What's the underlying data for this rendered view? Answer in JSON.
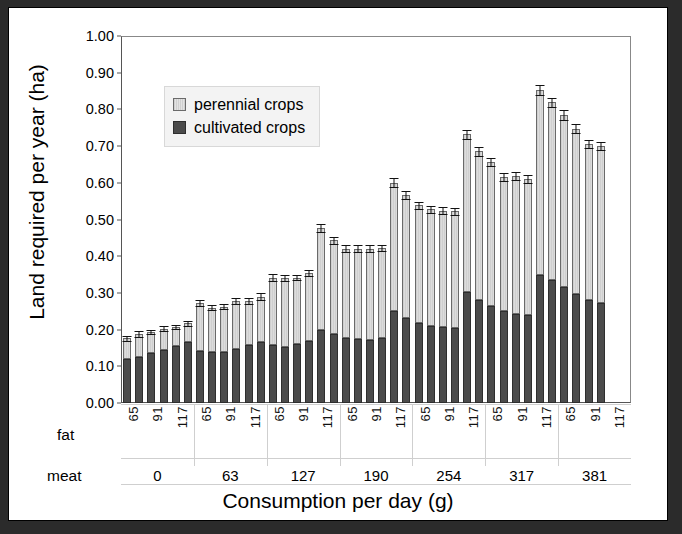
{
  "chart_data": {
    "type": "bar",
    "subtype": "stacked-grouped-column-with-error-bars",
    "title": "",
    "xlabel": "Consumption per day (g)",
    "ylabel": "Land required per year (ha)",
    "ylim": [
      0.0,
      1.0
    ],
    "ytick_labels": [
      "1.00",
      "0.90",
      "0.80",
      "0.70",
      "0.60",
      "0.50",
      "0.40",
      "0.30",
      "0.20",
      "0.10",
      "0.00"
    ],
    "ytick_values": [
      1.0,
      0.9,
      0.8,
      0.7,
      0.6,
      0.5,
      0.4,
      0.3,
      0.2,
      0.1,
      0.0
    ],
    "grid": false,
    "legend_position": "upper-left-inside",
    "axis_row_labels": {
      "fat": "fat",
      "meat": "meat"
    },
    "meat_groups": [
      "0",
      "63",
      "127",
      "190",
      "254",
      "317",
      "381"
    ],
    "fat_levels": [
      "65",
      "91",
      "117"
    ],
    "bars_per_group": 6,
    "series": [
      {
        "name": "cultivated crops",
        "color": "#4b4b4b",
        "values": [
          0.12,
          0.125,
          0.135,
          0.145,
          0.155,
          0.165,
          0.142,
          0.138,
          0.139,
          0.148,
          0.158,
          0.167,
          0.157,
          0.153,
          0.162,
          0.17,
          0.2,
          0.187,
          0.178,
          0.174,
          0.172,
          0.177,
          0.25,
          0.232,
          0.219,
          0.211,
          0.206,
          0.205,
          0.302,
          0.281,
          0.264,
          0.251,
          0.243,
          0.24,
          0.35,
          0.334,
          0.315,
          0.297,
          0.281,
          0.273,
          0.0,
          0.0
        ]
      },
      {
        "name": "perennial crops",
        "color": "#d0d0d0",
        "values": [
          0.056,
          0.063,
          0.058,
          0.058,
          0.052,
          0.052,
          0.13,
          0.122,
          0.123,
          0.129,
          0.121,
          0.123,
          0.185,
          0.188,
          0.18,
          0.184,
          0.278,
          0.256,
          0.243,
          0.247,
          0.249,
          0.245,
          0.35,
          0.335,
          0.32,
          0.317,
          0.318,
          0.317,
          0.43,
          0.405,
          0.392,
          0.364,
          0.376,
          0.37,
          0.503,
          0.485,
          0.47,
          0.45,
          0.425,
          0.427,
          0.0,
          0.0
        ]
      }
    ],
    "totals": [
      0.176,
      0.188,
      0.193,
      0.203,
      0.207,
      0.217,
      0.272,
      0.26,
      0.262,
      0.277,
      0.279,
      0.29,
      0.342,
      0.341,
      0.342,
      0.354,
      0.478,
      0.443,
      0.421,
      0.421,
      0.421,
      0.422,
      0.6,
      0.567,
      0.539,
      0.528,
      0.524,
      0.522,
      0.732,
      0.686,
      0.656,
      0.615,
      0.619,
      0.61,
      0.853,
      0.819,
      0.785,
      0.747,
      0.706,
      0.7,
      0.0,
      0.0
    ],
    "error_bars": [
      0.006,
      0.007,
      0.006,
      0.006,
      0.006,
      0.007,
      0.008,
      0.007,
      0.007,
      0.008,
      0.008,
      0.009,
      0.009,
      0.008,
      0.008,
      0.009,
      0.011,
      0.01,
      0.009,
      0.009,
      0.009,
      0.009,
      0.012,
      0.011,
      0.01,
      0.01,
      0.01,
      0.01,
      0.013,
      0.012,
      0.011,
      0.011,
      0.011,
      0.011,
      0.014,
      0.013,
      0.013,
      0.012,
      0.011,
      0.011,
      0.0,
      0.0
    ]
  },
  "legend": {
    "items": [
      {
        "label": "perennial crops",
        "swatch": "perennial-swatch"
      },
      {
        "label": "cultivated crops",
        "swatch": "cultivated-swatch"
      }
    ]
  }
}
